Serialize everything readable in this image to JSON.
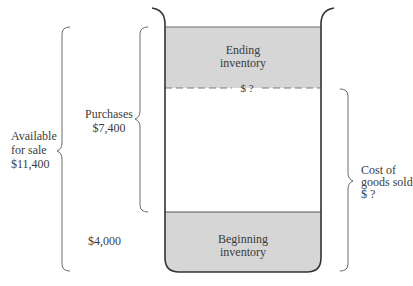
{
  "diagram": {
    "type": "inventory-container",
    "colors": {
      "fill": "#d6d6d6",
      "stroke": "#3a3a3a",
      "brace": "#6a6a6a",
      "dash": "#7a7a7a"
    },
    "container": {
      "ending_inventory": {
        "line1": "Ending",
        "line2": "inventory"
      },
      "dashed_marker": "$ ?",
      "beginning_inventory": {
        "line1": "Beginning",
        "line2": "inventory"
      }
    },
    "left_labels": {
      "available": {
        "line1": "Available",
        "line2": "for sale",
        "line3": "$11,400"
      },
      "purchases": {
        "line1": "Purchases",
        "line2": "$7,400"
      },
      "beginning_amount": "$4,000"
    },
    "right_labels": {
      "cogs": {
        "line1": "Cost of",
        "line2": "goods sold",
        "line3": "$ ?"
      }
    }
  }
}
